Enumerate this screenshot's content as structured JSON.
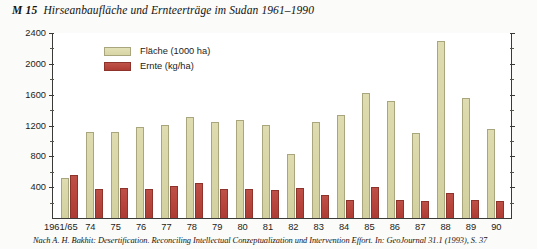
{
  "title": {
    "code": "M 15",
    "text": "Hirseanbaufläche und Ernteerträge im Sudan 1961–1990"
  },
  "legend": {
    "position": "inside-top-left",
    "items": [
      {
        "label": "Fläche (1000 ha)",
        "color": "#d9d7a8",
        "swatch": "flaeche-swatch"
      },
      {
        "label": "Ernte (kg/ha)",
        "color": "#b8453c",
        "swatch": "ernte-swatch"
      }
    ]
  },
  "source": "Nach A. H. Bakhit: Desertification. Reconciling Intellectual Conzeptualization und Intervention Effort. In: GeoJournal 31.1 (1993), S. 37",
  "chart_data": {
    "type": "bar",
    "title": "Hirseanbaufläche und Ernteerträge im Sudan 1961–1990",
    "xlabel": "",
    "ylabel": "",
    "ylim": [
      0,
      2400
    ],
    "yticks": [
      400,
      800,
      1200,
      1600,
      2000,
      2400
    ],
    "ytick_labels": [
      "400",
      "800",
      "1200",
      "1600",
      "2000",
      "2400"
    ],
    "minor_tick_step": 200,
    "grid": false,
    "axis_style": "left-and-right-ticks",
    "categories": [
      "1961/65",
      "74",
      "75",
      "76",
      "77",
      "78",
      "79",
      "80",
      "81",
      "82",
      "83",
      "84",
      "85",
      "86",
      "87",
      "88",
      "89",
      "90"
    ],
    "series": [
      {
        "name": "Fläche (1000 ha)",
        "color": "#d9d7a8",
        "values": [
          520,
          1110,
          1110,
          1180,
          1210,
          1310,
          1250,
          1270,
          1210,
          830,
          1250,
          1330,
          1620,
          1520,
          1100,
          2290,
          1560,
          1150
        ]
      },
      {
        "name": "Ernte (kg/ha)",
        "color": "#b8453c",
        "values": [
          560,
          370,
          390,
          380,
          420,
          460,
          370,
          370,
          360,
          390,
          300,
          235,
          400,
          230,
          215,
          320,
          230,
          220
        ]
      }
    ]
  }
}
